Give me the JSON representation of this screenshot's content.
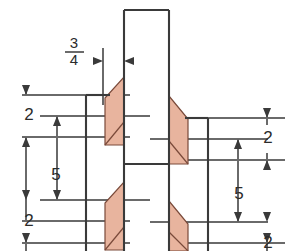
{
  "drawing": {
    "title": "Welded plate connection cross-section",
    "background_color": "#ffffff",
    "object_line_color": "#3a3a3a",
    "dimension_line_color": "#5a5a5a",
    "weld_fill_color": "#e8b49e",
    "weld_edge_color": "#7a4a3a",
    "text_color": "#2b2b2b"
  },
  "dimensions": {
    "gap": {
      "numerator": "3",
      "denominator": "4",
      "label": "3/4"
    },
    "left": {
      "top": "2",
      "middle": "5",
      "bottom": "2"
    },
    "right": {
      "top": "2",
      "middle": "5",
      "bottom": "2"
    }
  },
  "geometry": {
    "shaft": {
      "x1": 124,
      "x2": 169,
      "y_top": 10
    },
    "left_plate_edge_x": 86,
    "right_plate_edge_x": 208,
    "left_plate_top_y": 95,
    "right_plate_top_y": 118
  }
}
